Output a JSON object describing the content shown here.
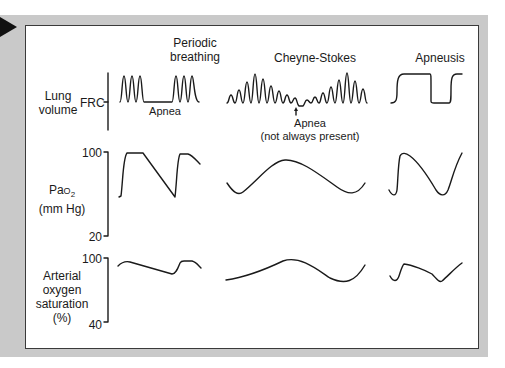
{
  "columns": [
    {
      "id": "periodic",
      "title_line1": "Periodic",
      "title_line2": "breathing",
      "annotation": "Apnea"
    },
    {
      "id": "cheyne",
      "title": "Cheyne-Stokes",
      "annotation_line1": "Apnea",
      "annotation_line2": "(not always present)"
    },
    {
      "id": "apneusis",
      "title": "Apneusis"
    }
  ],
  "rows": [
    {
      "id": "lung",
      "label_line1": "Lung",
      "label_line2": "volume",
      "tick": "FRC"
    },
    {
      "id": "pao2",
      "label_main": "Pa",
      "label_sub_prefix": "O",
      "label_sub": "2",
      "label_line2": "(mm Hg)",
      "tick_top": "100",
      "tick_bottom": "20"
    },
    {
      "id": "sao2",
      "label_line1": "Arterial",
      "label_line2": "oxygen",
      "label_line3": "saturation",
      "label_line4": "(%)",
      "tick_top": "100",
      "tick_bottom": "40"
    }
  ],
  "colors": {
    "frame": "#c9c9c9",
    "stroke": "#1a1a1a",
    "panel": "#ffffff"
  },
  "icons": {
    "arrow": "play-triangle-icon"
  }
}
